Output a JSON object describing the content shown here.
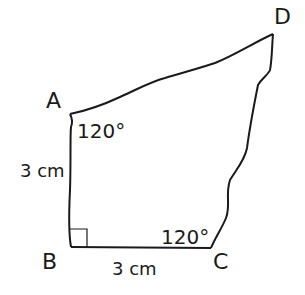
{
  "figure": {
    "vertices": {
      "A": "A",
      "B": "B",
      "C": "C",
      "D": "D"
    },
    "angles": {
      "A": "120°",
      "C": "120°",
      "B": "right angle"
    },
    "sides": {
      "AB": "3 cm",
      "BC": "3 cm"
    },
    "colors": {
      "stroke": "#1a1a1a",
      "background": "#ffffff"
    }
  }
}
